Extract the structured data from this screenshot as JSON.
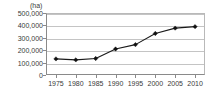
{
  "chart_data": {
    "type": "line",
    "title": "",
    "subtitle": "",
    "xlabel": "",
    "ylabel": "",
    "unit_label": "(ha)",
    "categories": [
      "1975",
      "1980",
      "1985",
      "1990",
      "1995",
      "2000",
      "2005",
      "2010"
    ],
    "x": [
      1975,
      1980,
      1985,
      1990,
      1995,
      2000,
      2005,
      2010
    ],
    "values": [
      130000,
      122000,
      133000,
      210000,
      245000,
      335000,
      378000,
      390000
    ],
    "series": [
      {
        "name": "",
        "values": [
          130000,
          122000,
          133000,
          210000,
          245000,
          335000,
          378000,
          390000
        ]
      }
    ],
    "ylim": [
      0,
      500000
    ],
    "xlim": [
      1972.5,
      2012.5
    ],
    "ytick_labels": [
      "500,000",
      "400,000",
      "300,000",
      "200,000",
      "100,000",
      "0"
    ],
    "ytick_values": [
      500000,
      400000,
      300000,
      200000,
      100000,
      0
    ],
    "grid": true,
    "grid_axis": "y",
    "legend": false,
    "legend_position": "none",
    "marker": "diamond",
    "line_color": "#1a1a1a",
    "marker_color": "#111111",
    "grid_color": "#c4c4c4",
    "axis_color": "#8a8a8a",
    "background": "#ffffff",
    "annotations": []
  }
}
